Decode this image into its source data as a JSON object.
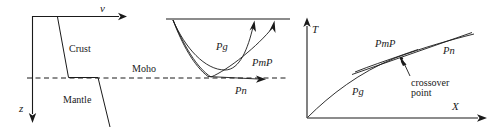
{
  "figure": {
    "panels": [
      {
        "id": "velocity-depth-model",
        "name": "Velocity depth profile",
        "axes": {
          "horizontal_label": "v",
          "vertical_label": "z"
        },
        "layers": [
          {
            "label": "Crust"
          },
          {
            "label": "Mantle"
          }
        ],
        "interface_label": "Moho"
      },
      {
        "id": "ray-path-diagram",
        "name": "Ray paths from source",
        "rays": [
          {
            "label": "Pg"
          },
          {
            "label": "PmP"
          },
          {
            "label": "Pn"
          }
        ],
        "interface_label": "Moho"
      },
      {
        "id": "travel-time-curves",
        "name": "Travel time curves",
        "axes": {
          "horizontal_label": "X",
          "vertical_label": "T"
        },
        "curves": [
          {
            "label": "Pg"
          },
          {
            "label": "PmP"
          },
          {
            "label": "Pn"
          }
        ],
        "annotation": {
          "line1": "crossover",
          "line2": "point"
        }
      }
    ],
    "colors": {
      "ink": "#1a1a1a",
      "background": "#ffffff"
    }
  }
}
